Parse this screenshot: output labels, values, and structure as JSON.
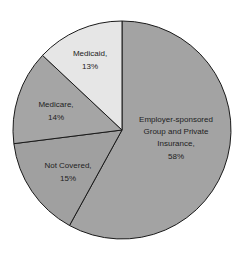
{
  "chart_data": {
    "type": "pie",
    "title": "",
    "start_angle_deg": 0,
    "direction": "clockwise",
    "slices": [
      {
        "label": "Employer-sponsored Group and Private Insurance",
        "value": 58,
        "value_label": "58%",
        "color": "#a3a3a3"
      },
      {
        "label": "Not Covered",
        "value": 15,
        "value_label": "15%",
        "color": "#a0a0a0"
      },
      {
        "label": "Medicare",
        "value": 14,
        "value_label": "14%",
        "color": "#a5a5a5"
      },
      {
        "label": "Medicaid",
        "value": 13,
        "value_label": "13%",
        "color": "#e6e6e6"
      }
    ],
    "labels": {
      "employer": [
        "Employer-sponsored",
        "Group and Private",
        "Insurance,",
        "58%"
      ],
      "not_covered": [
        "Not Covered,",
        "15%"
      ],
      "medicare": [
        "Medicare,",
        "14%"
      ],
      "medicaid": [
        "Medicaid,",
        "13%"
      ]
    }
  }
}
